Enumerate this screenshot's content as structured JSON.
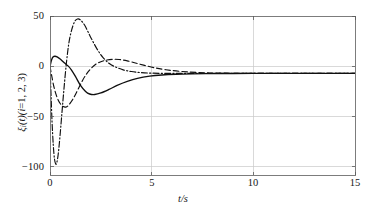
{
  "chart_data": {
    "type": "line",
    "title": "",
    "subtitle": "",
    "xlabel": "t/s",
    "ylabel": "ξᵢ(t)(i=1, 2, 3)",
    "ylabel_parts": {
      "symbol": "ξ",
      "subscript": "i",
      "arg": "(t)",
      "index_note": "(i=1, 2, 3)"
    },
    "xlim": [
      0,
      15
    ],
    "ylim": [
      -108,
      50
    ],
    "xticks": [
      0,
      5,
      10,
      15
    ],
    "xticklabels": [
      "0",
      "5",
      "10",
      "15"
    ],
    "yticks": [
      50,
      0,
      -50,
      -100
    ],
    "yticklabels": [
      "50",
      "0",
      "−50",
      "−100"
    ],
    "grid": true,
    "grid_color": "#c8c8c8",
    "frame_color": "#6e6e6e",
    "legend": null,
    "legend_position": "none",
    "line_color": "#101010",
    "series": [
      {
        "name": "ξ₁(t)",
        "linestyle": "solid",
        "color": "#101010",
        "x": [
          0,
          0.08,
          0.16,
          0.25,
          0.35,
          0.5,
          0.7,
          0.9,
          1.05,
          1.25,
          1.5,
          1.75,
          1.95,
          2.2,
          2.5,
          2.9,
          3.3,
          3.8,
          4.3,
          4.9,
          5.5,
          6.2,
          7.0,
          8.0,
          9.0,
          10.5,
          12.0,
          13.5,
          15.0
        ],
        "y": [
          0,
          6.5,
          9.5,
          10,
          9.3,
          7.2,
          3.5,
          0.2,
          -3.5,
          -10,
          -19,
          -25,
          -27.5,
          -28,
          -26.5,
          -23,
          -19,
          -15,
          -12,
          -9.8,
          -8.6,
          -7.9,
          -7.5,
          -7.2,
          -7.1,
          -7.0,
          -7.0,
          -7.0,
          -7.0
        ]
      },
      {
        "name": "ξ₂(t)",
        "linestyle": "dashed",
        "color": "#101010",
        "x": [
          0,
          0.08,
          0.2,
          0.35,
          0.5,
          0.65,
          0.78,
          0.9,
          1.05,
          1.2,
          1.4,
          1.6,
          1.8,
          2.0,
          2.25,
          2.5,
          2.8,
          3.1,
          3.4,
          3.8,
          4.2,
          4.6,
          5.1,
          5.7,
          6.4,
          7.2,
          8.2,
          9.5,
          11.0,
          13.0,
          15.0
        ],
        "y": [
          0,
          -9,
          -21,
          -31,
          -37,
          -40,
          -40.5,
          -39,
          -35,
          -30,
          -22,
          -14,
          -7.5,
          -2.5,
          2.0,
          4.6,
          6.3,
          7.0,
          6.8,
          5.4,
          3.3,
          1.2,
          -1.3,
          -3.4,
          -5.0,
          -6.1,
          -6.7,
          -7.0,
          -7.0,
          -7.0,
          -7.0
        ]
      },
      {
        "name": "ξ₃(t)",
        "linestyle": "dashdot",
        "color": "#101010",
        "x": [
          0,
          0.05,
          0.1,
          0.16,
          0.22,
          0.28,
          0.33,
          0.4,
          0.48,
          0.58,
          0.68,
          0.8,
          0.92,
          1.05,
          1.2,
          1.35,
          1.5,
          1.7,
          1.9,
          2.1,
          2.35,
          2.6,
          2.9,
          3.2,
          3.6,
          4.0,
          4.5,
          5.0,
          5.7,
          6.5,
          7.5,
          9.0,
          11.0,
          13.0,
          15.0
        ],
        "y": [
          0,
          -28,
          -55,
          -78,
          -92,
          -97,
          -96,
          -88,
          -72,
          -48,
          -24,
          2,
          22,
          35,
          44,
          47,
          46,
          41,
          33,
          25,
          16,
          9,
          3,
          -0.5,
          -3.5,
          -5.2,
          -6.3,
          -6.8,
          -7.0,
          -7.0,
          -7.0,
          -7.0,
          -7.0,
          -7.0,
          -7.0
        ]
      }
    ],
    "annotations": [],
    "features": {
      "solid_peak": {
        "t": 0.25,
        "value": 10
      },
      "solid_trough": {
        "t": 2.05,
        "value": -28
      },
      "dashed_trough": {
        "t": 0.78,
        "value": -40.5
      },
      "dashed_peak": {
        "t": 3.1,
        "value": 7
      },
      "dashdot_trough": {
        "t": 0.28,
        "value": -97
      },
      "dashdot_peak": {
        "t": 1.35,
        "value": 47
      },
      "steady_state": -7
    }
  },
  "axes": {
    "x": {
      "label": "t/s",
      "ticks": [
        "0",
        "5",
        "10",
        "15"
      ]
    },
    "y": {
      "label": "ξᵢ(t)(i=1, 2, 3)",
      "ticks": [
        "50",
        "0",
        "−50",
        "−100"
      ]
    }
  },
  "ylabel_pieces": {
    "xi": "ξ",
    "sub_i": "i",
    "paren_t": "(t)(",
    "i_eq": "i",
    "rest": "=1, 2, 3)"
  }
}
